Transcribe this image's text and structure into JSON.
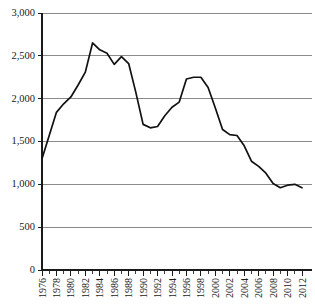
{
  "chart_data": {
    "type": "line",
    "title": "",
    "subtitle": "",
    "xlabel": "",
    "ylabel": "",
    "xlim": [
      1976,
      2012
    ],
    "ylim": [
      0,
      3000
    ],
    "grid": true,
    "legend": "none",
    "y_ticks": [
      0,
      500,
      1000,
      1500,
      2000,
      2500,
      3000
    ],
    "y_tick_labels": [
      "0",
      "500",
      "1,000",
      "1,500",
      "2,000",
      "2,500",
      "3,000"
    ],
    "x_ticks": [
      1976,
      1978,
      1980,
      1982,
      1984,
      1986,
      1988,
      1990,
      1992,
      1994,
      1996,
      1998,
      2000,
      2002,
      2004,
      2006,
      2008,
      2010,
      2012
    ],
    "x_tick_labels": [
      "1976",
      "1978",
      "1980",
      "1982",
      "1984",
      "1986",
      "1988",
      "1990",
      "1992",
      "1994",
      "1996",
      "1998",
      "2000",
      "2002",
      "2004",
      "2006",
      "2008",
      "2010",
      "2012"
    ],
    "x_minor_ticks_every": 1,
    "line_color": "#111111",
    "grid_color": "#8a8a8a",
    "axis_color": "#1a1a1a",
    "x": [
      1976,
      1977,
      1978,
      1979,
      1980,
      1981,
      1982,
      1983,
      1984,
      1985,
      1986,
      1987,
      1988,
      1989,
      1990,
      1991,
      1992,
      1993,
      1994,
      1995,
      1996,
      1997,
      1998,
      1999,
      2000,
      2001,
      2002,
      2003,
      2004,
      2005,
      2006,
      2007,
      2008,
      2009,
      2010,
      2011,
      2012
    ],
    "values": [
      1300,
      1570,
      1840,
      1940,
      2020,
      2160,
      2310,
      2650,
      2570,
      2530,
      2400,
      2490,
      2410,
      2070,
      1700,
      1660,
      1675,
      1800,
      1900,
      1960,
      2230,
      2250,
      2250,
      2130,
      1890,
      1640,
      1580,
      1570,
      1450,
      1270,
      1210,
      1130,
      1010,
      960,
      990,
      1000,
      960
    ],
    "series": [
      {
        "name": "value",
        "values": [
          1300,
          1570,
          1840,
          1940,
          2020,
          2160,
          2310,
          2650,
          2570,
          2530,
          2400,
          2490,
          2410,
          2070,
          1700,
          1660,
          1675,
          1800,
          1900,
          1960,
          2230,
          2250,
          2250,
          2130,
          1890,
          1640,
          1580,
          1570,
          1450,
          1270,
          1210,
          1130,
          1010,
          960,
          990,
          1000,
          960
        ]
      }
    ],
    "annotations": []
  },
  "layout": {
    "plot_left": 42,
    "plot_right": 302,
    "plot_top": 13,
    "plot_bottom": 270
  }
}
